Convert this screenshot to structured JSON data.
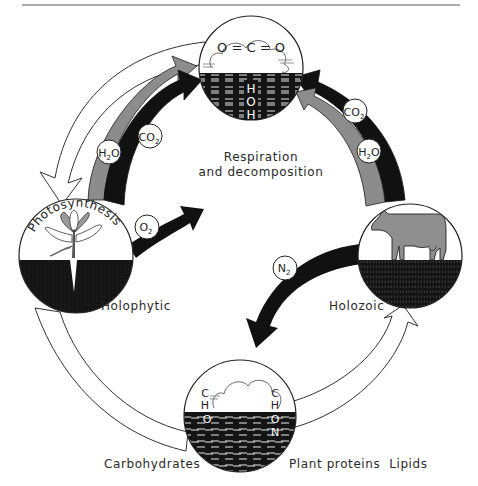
{
  "diagram": {
    "type": "cycle",
    "title_rule": true,
    "nodes": {
      "atmosphere": {
        "molecule_air": "O = C = O",
        "molecule_water": [
          "H",
          "O",
          "H"
        ]
      },
      "photosynthesis": {
        "arc_label": "Photosynthesis",
        "caption": "Holophytic"
      },
      "animal": {
        "caption": "Holozoic"
      },
      "organic": {
        "left_elements": [
          "C",
          "H",
          "O"
        ],
        "right_elements": [
          "C",
          "H",
          "O",
          "N"
        ]
      }
    },
    "center_label": {
      "line1": "Respiration",
      "line2": "and decomposition"
    },
    "bottom_labels": {
      "left": "Carbohydrates",
      "right": "Plant proteins  Lipids"
    },
    "arrows": {
      "left_inbound_gray": {
        "molecule": "H₂O",
        "sub_main": "H",
        "sub_num": "2",
        "sub_tail": "O"
      },
      "left_inbound_black": {
        "molecule": "CO₂",
        "sub_main": "CO",
        "sub_num": "2"
      },
      "oxygen_out": {
        "molecule": "O₂",
        "sub_main": "O",
        "sub_num": "2"
      },
      "right_black": {
        "molecule": "CO₂",
        "sub_main": "CO",
        "sub_num": "2"
      },
      "right_gray": {
        "molecule": "H₂O",
        "sub_main": "H",
        "sub_num": "2",
        "sub_tail": "O"
      },
      "nitrogen": {
        "molecule": "N₂",
        "sub_main": "N",
        "sub_num": "2"
      }
    },
    "colors": {
      "black": "#111111",
      "gray_arrow": "#8c8c8c",
      "line": "#333333",
      "plant_gray": "#9a9a9a",
      "cow_gray": "#8f8f8f"
    }
  }
}
